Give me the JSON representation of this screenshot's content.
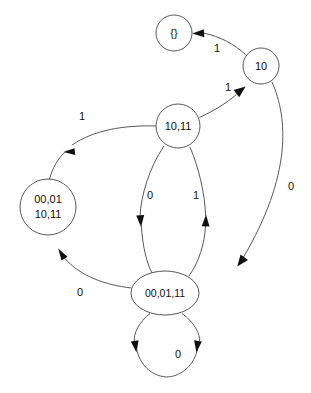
{
  "diagram": {
    "kind": "finite-state-machine",
    "title": "",
    "background_color": "#ffffff",
    "stroke_color": "#58585a",
    "text_color": "#101010",
    "arrow_color": "#101010",
    "canvas": {
      "width": 311,
      "height": 393
    }
  },
  "nodes": [
    {
      "id": "empty",
      "label": "{}",
      "lines": [
        "{}"
      ],
      "shape": "circle",
      "cx": 174,
      "cy": 33,
      "r": 18
    },
    {
      "id": "s10",
      "label": "10",
      "lines": [
        "10"
      ],
      "shape": "circle",
      "cx": 261,
      "cy": 66,
      "r": 18
    },
    {
      "id": "s1011",
      "label": "10,11",
      "lines": [
        "10,11"
      ],
      "shape": "circle",
      "cx": 178,
      "cy": 126,
      "r": 22
    },
    {
      "id": "s00011011",
      "label": "00,01 10,11",
      "lines": [
        "00,01",
        "10,11"
      ],
      "shape": "circle",
      "cx": 48,
      "cy": 207,
      "r": 28
    },
    {
      "id": "s000111",
      "label": "00,01,11",
      "lines": [
        "00,01,11"
      ],
      "shape": "ellipse",
      "cx": 165,
      "cy": 293,
      "rx": 34,
      "ry": 22
    }
  ],
  "edges": [
    {
      "id": "e-10-to-empty",
      "from": "s10",
      "to": "empty",
      "label": "1",
      "label_x": 217,
      "label_y": 49
    },
    {
      "id": "e-1011-to-10",
      "from": "s1011",
      "to": "s10",
      "label": "1",
      "label_x": 228,
      "label_y": 88
    },
    {
      "id": "e-10-to-000111",
      "from": "s10",
      "to": "s000111",
      "label": "0",
      "label_x": 291,
      "label_y": 187
    },
    {
      "id": "e-1011-to-00011011",
      "from": "s1011",
      "to": "s00011011",
      "label": "1",
      "label_x": 82,
      "label_y": 117
    },
    {
      "id": "e-1011-to-000111",
      "from": "s1011",
      "to": "s000111",
      "label": "0",
      "label_x": 150,
      "label_y": 196
    },
    {
      "id": "e-000111-to-1011",
      "from": "s000111",
      "to": "s1011",
      "label": "1",
      "label_x": 196,
      "label_y": 196
    },
    {
      "id": "e-000111-to-00011011",
      "from": "s000111",
      "to": "s00011011",
      "label": "0",
      "label_x": 80,
      "label_y": 293
    },
    {
      "id": "e-000111-self",
      "from": "s000111",
      "to": "s000111",
      "label": "0",
      "label_x": 178,
      "label_y": 355
    }
  ]
}
